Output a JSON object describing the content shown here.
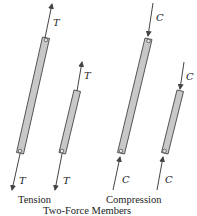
{
  "diagram": {
    "title": "Two-Force Members",
    "groups": [
      {
        "name": "Tension",
        "caption": "Tension",
        "force_symbol": "T",
        "members": [
          {
            "id": "tension-long",
            "length": "long",
            "top_label": "T",
            "bottom_label": "T",
            "force_direction": "outward"
          },
          {
            "id": "tension-short",
            "length": "short",
            "top_label": "T",
            "bottom_label": "T",
            "force_direction": "outward"
          }
        ]
      },
      {
        "name": "Compression",
        "caption": "Compression",
        "force_symbol": "C",
        "members": [
          {
            "id": "compression-long",
            "length": "long",
            "top_label": "C",
            "bottom_label": "C",
            "force_direction": "inward"
          },
          {
            "id": "compression-short",
            "length": "short",
            "top_label": "C",
            "bottom_label": "C",
            "force_direction": "inward"
          }
        ]
      }
    ],
    "colors": {
      "member_fill": "#c8c8c8",
      "stroke": "#444444",
      "text": "#222222"
    }
  }
}
